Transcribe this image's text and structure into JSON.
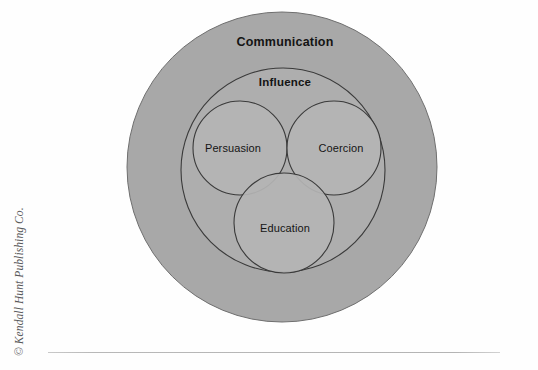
{
  "figure": {
    "type": "venn-diagram",
    "outer_circle": {
      "label": "Communication",
      "fill_color": "#a8a8a8",
      "stroke_color": "#6f6f6f",
      "cx": 282,
      "cy": 167,
      "r": 155
    },
    "middle_circle": {
      "label": "Influence",
      "fill_color": "#aeaeae",
      "stroke_color": "#3a3a3a",
      "cx": 283,
      "cy": 170,
      "r": 102
    },
    "inner_circles": [
      {
        "label": "Persuasion",
        "fill_color": "#b4b4b4",
        "stroke_color": "#3a3a3a",
        "cx": 240,
        "cy": 148,
        "r": 47
      },
      {
        "label": "Coercion",
        "fill_color": "#b4b4b4",
        "stroke_color": "#3a3a3a",
        "cx": 334,
        "cy": 148,
        "r": 47
      },
      {
        "label": "Education",
        "fill_color": "#b4b4b4",
        "stroke_color": "#3a3a3a",
        "cx": 284,
        "cy": 223,
        "r": 50
      }
    ],
    "label_positions": {
      "communication": {
        "x": 285,
        "y": 46
      },
      "influence": {
        "x": 285,
        "y": 86
      },
      "persuasion": {
        "x": 233,
        "y": 152
      },
      "coercion": {
        "x": 341,
        "y": 152
      },
      "education": {
        "x": 285,
        "y": 232
      }
    }
  },
  "credit": {
    "text": "© Kendall Hunt Publishing Co.",
    "color": "#58585a"
  },
  "page": {
    "background": "#fefefe",
    "rule_color": "#b8b8b8"
  }
}
